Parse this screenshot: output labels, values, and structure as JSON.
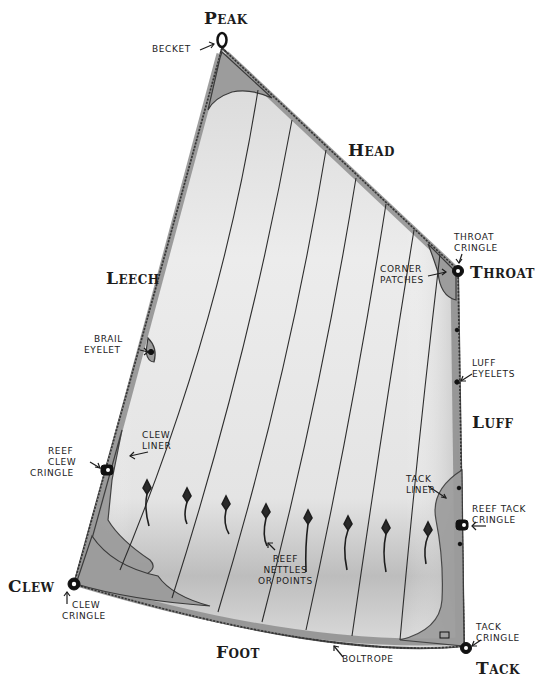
{
  "diagram": {
    "colors": {
      "background": "#ffffff",
      "sail_cloth": "#e2e2e2",
      "sail_shadow": "#c4c4c4",
      "patch": "#9a9a9a",
      "boltrope": "#5a5a5a",
      "ink": "#1c1c1c"
    },
    "corners": {
      "peak": "Peak",
      "throat": "Throat",
      "clew": "Clew",
      "tack": "Tack"
    },
    "edges": {
      "head": "Head",
      "leech": "Leech",
      "luff": "Luff",
      "foot": "Foot"
    },
    "callouts": {
      "becket": "Becket",
      "throat_cringle": [
        "Throat",
        "Cringle"
      ],
      "corner_patches": [
        "Corner",
        "Patches"
      ],
      "brail_eyelet": [
        "Brail",
        "Eyelet"
      ],
      "luff_eyelets": [
        "Luff",
        "Eyelets"
      ],
      "clew_liner": [
        "Clew",
        "Liner"
      ],
      "reef_clew_cringle": [
        "Reef",
        "Clew",
        "Cringle"
      ],
      "tack_liner": [
        "Tack",
        "Liner"
      ],
      "reef_tack_cringle": [
        "Reef Tack",
        "Cringle"
      ],
      "reef_nettles": [
        "Reef",
        "Nettles",
        "or Points"
      ],
      "clew_cringle": [
        "Clew",
        "Cringle"
      ],
      "boltrope": "Boltrope",
      "tack_cringle": [
        "Tack",
        "Cringle"
      ]
    }
  }
}
